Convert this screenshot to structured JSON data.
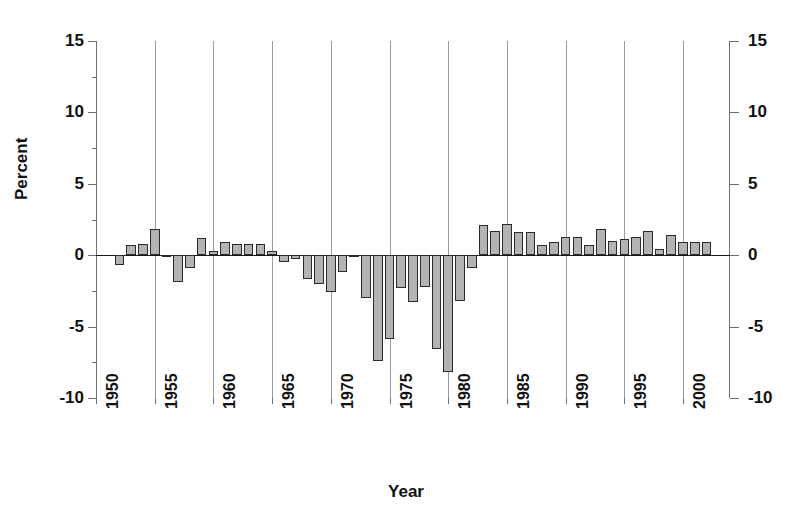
{
  "chart_data": {
    "type": "bar",
    "title": "",
    "subtitle": "",
    "xlabel": "Year",
    "ylabel": "Percent",
    "ylim": [
      -10,
      15
    ],
    "xlim": [
      1950,
      2004
    ],
    "ytick_labels_left": [
      "15",
      "10",
      "5",
      "0",
      "-5",
      "-10"
    ],
    "ytick_labels_right": [
      "15",
      "10",
      "5",
      "0",
      "-5",
      "-10"
    ],
    "ytick_values": [
      15,
      10,
      5,
      0,
      -5,
      -10
    ],
    "xtick_labels": [
      "1950",
      "1955",
      "1960",
      "1965",
      "1970",
      "1975",
      "1980",
      "1985",
      "1990",
      "1995",
      "2000"
    ],
    "xtick_values": [
      1950,
      1955,
      1960,
      1965,
      1970,
      1975,
      1980,
      1985,
      1990,
      1995,
      2000
    ],
    "gridlines": {
      "vertical": [
        1955,
        1960,
        1965,
        1970,
        1975,
        1980,
        1985,
        1990,
        1995,
        2000
      ],
      "horizontal": [
        0
      ],
      "grid_on": true
    },
    "legend": {
      "entries": [],
      "position": "none"
    },
    "annotations": [],
    "bar_fill_color": "#b3b3b3",
    "bar_edge_color": "#2b2b2b",
    "axis_color": "#6f6f6f",
    "grid_color": "#9a9a9a",
    "text_color": "#111111",
    "background_color": "#ffffff",
    "categories": [
      1952,
      1953,
      1954,
      1955,
      1956,
      1957,
      1958,
      1959,
      1960,
      1961,
      1962,
      1963,
      1964,
      1965,
      1966,
      1967,
      1968,
      1969,
      1970,
      1971,
      1972,
      1973,
      1974,
      1975,
      1976,
      1977,
      1978,
      1979,
      1980,
      1981,
      1982,
      1983,
      1984,
      1985,
      1986,
      1987,
      1988,
      1989,
      1990,
      1991,
      1992,
      1993,
      1994,
      1995,
      1996,
      1997,
      1998,
      1999,
      2000,
      2001,
      2002
    ],
    "values": [
      -0.7,
      0.7,
      0.8,
      1.8,
      -0.1,
      -1.9,
      -0.9,
      1.2,
      0.3,
      0.9,
      0.8,
      0.8,
      0.8,
      0.3,
      -0.5,
      -0.3,
      -1.7,
      -2.0,
      -2.6,
      -1.2,
      -0.1,
      -3.0,
      -7.4,
      -5.9,
      -2.3,
      -3.3,
      -2.2,
      -6.6,
      -8.2,
      -3.2,
      -0.9,
      2.1,
      1.7,
      2.2,
      1.6,
      1.6,
      0.7,
      0.9,
      1.3,
      1.3,
      0.7,
      1.8,
      1.0,
      1.1,
      1.3,
      1.7,
      0.4,
      1.4,
      0.9,
      0.9,
      0.9
    ]
  }
}
